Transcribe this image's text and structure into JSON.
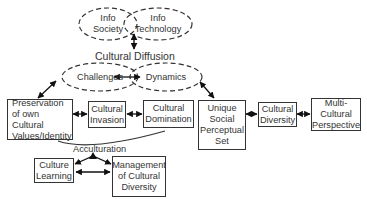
{
  "diagram": {
    "title": "Cultural Diffusion",
    "ellipses": {
      "info_society": "Info\nSociety",
      "info_technology": "Info\nTechnology",
      "challenges": "Challenges",
      "dynamics": "Dynamics"
    },
    "boxes": {
      "preservation": "Preservation\nof own Cultural\nValues/Identity",
      "cultural_invasion": "Cultural\nInvasion",
      "cultural_domination": "Cultural\nDomination",
      "unique_social": "Unique\nSocial\nPerceptual\nSet",
      "cultural_diversity": "Cultural\nDiversity",
      "multi_cultural": "Multi-\nCultural\nPerspective",
      "culture_learning": "Culture\nLearning",
      "management": "Management\nof Cultural\nDiversity"
    },
    "acculturation_label": "Acculturation",
    "colors": {
      "stroke": "#333333",
      "text": "#333333",
      "background": "#ffffff"
    }
  }
}
